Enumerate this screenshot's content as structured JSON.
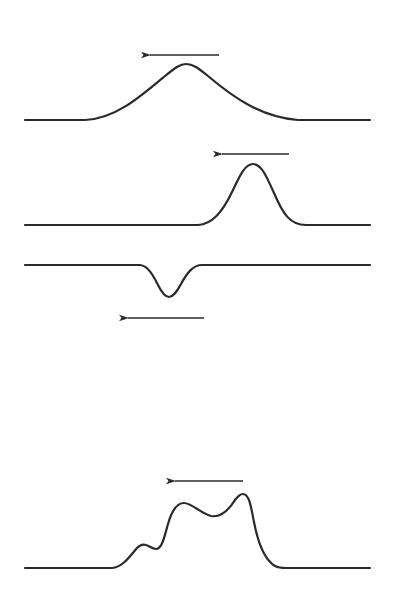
{
  "diagram": {
    "type": "wave-pulse-sequence",
    "stroke_color": "#2a2a2a",
    "background": "#ffffff",
    "panels": [
      {
        "id": "broad-pulse",
        "description": "Broad symmetric hump (positive pulse) moving left",
        "path": "M25,120 L85,120 C115,119 140,97 165,76 C175,68 180,64 186,64 C193,64 198,68 208,76 C235,99 262,117 298,120 L370,120",
        "arrow": {
          "x1": 219,
          "y1": 55,
          "x2": 142,
          "y2": 55,
          "direction": "left"
        }
      },
      {
        "id": "narrow-pulse",
        "description": "Narrow tall positive pulse moving left",
        "path": "M25,225 L198,225 C212,224 222,213 232,192 C240,175 245,164 253,164 C261,164 266,175 274,193 C283,214 290,225 306,225 L370,225",
        "arrow": {
          "x1": 289,
          "y1": 154,
          "x2": 214,
          "y2": 154,
          "direction": "left"
        }
      },
      {
        "id": "negative-pulse",
        "description": "Narrow negative pulse (trough) moving left",
        "path": "M25,265 L140,265 C148,266 153,275 158,285 C162,293 165,297 169,297 C173,297 176,293 181,284 C187,273 193,265 202,265 L370,265",
        "arrow": {
          "x1": 204,
          "y1": 318,
          "x2": 120,
          "y2": 318,
          "direction": "left"
        }
      },
      {
        "id": "composite-pulse",
        "description": "Composite multi-peaked pulse moving left",
        "path": "M25,568 L112,568 C123,567 130,556 137,548 C140,545 143,544 146,545 C150,546 152,549 156,549 C162,549 164,538 168,524 C172,510 177,503 184,503 C192,503 200,513 211,516 C222,518 230,508 235,500 C238,496 240,494 243,494 C249,494 251,506 254,522 C258,543 265,560 275,566 C279,568 282,568 286,568 L370,568",
        "arrow": {
          "x1": 243,
          "y1": 481,
          "x2": 167,
          "y2": 481,
          "direction": "left"
        }
      }
    ]
  }
}
